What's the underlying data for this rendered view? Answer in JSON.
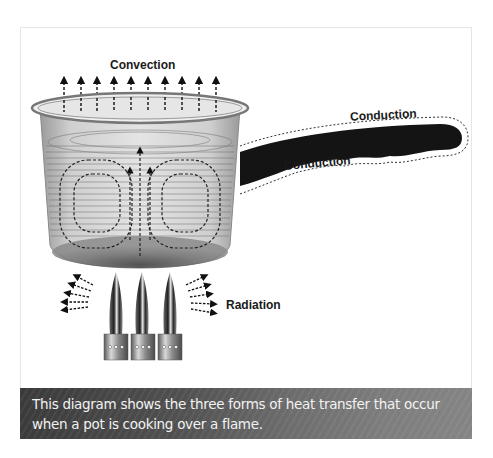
{
  "diagram": {
    "labels": {
      "convection": "Convection",
      "conduction_top": "Conduction",
      "conduction_bottom": "Conduction",
      "radiation": "Radiation"
    },
    "elements": [
      "pot",
      "water",
      "convection-currents",
      "handle",
      "burner-flames"
    ],
    "convection_arrow_count": 10,
    "burner_count": 3
  },
  "caption": {
    "text": "This diagram shows the three forms of heat transfer that occur when a pot is cooking over a flame."
  },
  "colors": {
    "caption_bg_dark": "#3a3a3a",
    "caption_bg_light": "#858585",
    "caption_text": "#f2f2f2",
    "label_text": "#1a1a1a",
    "handle": "#111111"
  }
}
